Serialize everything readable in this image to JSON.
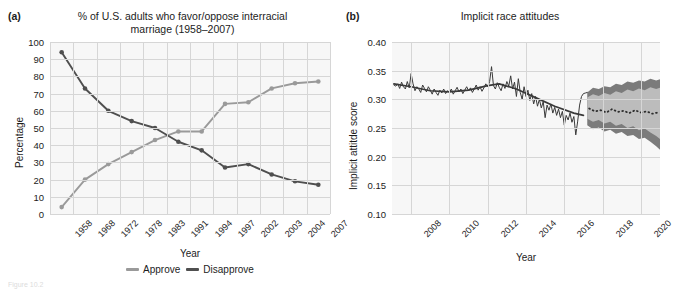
{
  "figure": {
    "background": "#ffffff",
    "caption_fragment": "Figure 10.2"
  },
  "panel_a": {
    "letter": "(a)",
    "title": "% of U.S. adults who favor/oppose interracial\nmarriage (1958–2007)",
    "title_line1": "% of U.S. adults who favor/oppose interracial",
    "title_line2": "marriage (1958–2007)",
    "xlabel": "Year",
    "ylabel": "Percentage",
    "legend": [
      {
        "label": "Approve",
        "color": "#9a9a9a"
      },
      {
        "label": "Disapprove",
        "color": "#4f4f4f"
      }
    ]
  },
  "panel_b": {
    "letter": "(b)",
    "title": "Implicit race attitudes",
    "xlabel": "Year",
    "ylabel": "Implicit attitde score"
  },
  "chart_data": [
    {
      "type": "line",
      "panel": "a",
      "title": "% of U.S. adults who favor/oppose interracial marriage (1958–2007)",
      "xlabel": "Year",
      "ylabel": "Percentage",
      "ylim": [
        0,
        100
      ],
      "yticks": [
        0,
        10,
        20,
        30,
        40,
        50,
        60,
        70,
        80,
        90,
        100
      ],
      "categories": [
        "1958",
        "1968",
        "1972",
        "1978",
        "1983",
        "1991",
        "1994",
        "1997",
        "2002",
        "2003",
        "2004",
        "2007"
      ],
      "grid": true,
      "legend_position": "bottom",
      "markers": true,
      "series": [
        {
          "name": "Approve",
          "color": "#9a9a9a",
          "values": [
            4,
            20,
            29,
            36,
            43,
            48,
            48,
            64,
            65,
            73,
            76,
            77
          ]
        },
        {
          "name": "Disapprove",
          "color": "#4f4f4f",
          "values": [
            94,
            73,
            60,
            54,
            50,
            42,
            37,
            27,
            29,
            23,
            19,
            17
          ]
        }
      ]
    },
    {
      "type": "line",
      "panel": "b",
      "title": "Implicit race attitudes",
      "xlabel": "Year",
      "ylabel": "Implicit attitde score",
      "ylim": [
        0.1,
        0.4
      ],
      "yticks": [
        0.1,
        0.15,
        0.2,
        0.25,
        0.3,
        0.35,
        0.4
      ],
      "xlim": [
        2007.0,
        2021.0
      ],
      "xticks": [
        2008,
        2010,
        2012,
        2014,
        2016,
        2018,
        2020
      ],
      "grid": true,
      "legend_position": "none",
      "forecast_start": 2017.2,
      "series": [
        {
          "name": "Observed",
          "color": "#3a3a3a",
          "style": "noisy-line",
          "x": [
            2007.1,
            2007.2,
            2007.3,
            2007.4,
            2007.5,
            2007.6,
            2007.7,
            2007.8,
            2007.9,
            2008.0,
            2008.1,
            2008.2,
            2008.3,
            2008.4,
            2008.5,
            2008.6,
            2008.7,
            2008.8,
            2008.9,
            2009.0,
            2009.1,
            2009.2,
            2009.3,
            2009.4,
            2009.5,
            2009.6,
            2009.7,
            2009.8,
            2009.9,
            2010.0,
            2010.1,
            2010.2,
            2010.3,
            2010.4,
            2010.5,
            2010.6,
            2010.7,
            2010.8,
            2010.9,
            2011.0,
            2011.1,
            2011.2,
            2011.3,
            2011.4,
            2011.5,
            2011.6,
            2011.7,
            2011.8,
            2011.9,
            2012.0,
            2012.1,
            2012.2,
            2012.3,
            2012.4,
            2012.5,
            2012.6,
            2012.7,
            2012.8,
            2012.9,
            2013.0,
            2013.1,
            2013.2,
            2013.3,
            2013.4,
            2013.5,
            2013.6,
            2013.7,
            2013.8,
            2013.9,
            2014.0,
            2014.1,
            2014.2,
            2014.3,
            2014.4,
            2014.5,
            2014.6,
            2014.7,
            2014.8,
            2014.9,
            2015.0,
            2015.1,
            2015.2,
            2015.3,
            2015.4,
            2015.5,
            2015.6,
            2015.7,
            2015.8,
            2015.9,
            2016.0,
            2016.1,
            2016.2,
            2016.3,
            2016.4,
            2016.5,
            2016.6,
            2016.7,
            2016.8,
            2016.9,
            2017.0,
            2017.1,
            2017.2
          ],
          "y": [
            0.325,
            0.323,
            0.327,
            0.319,
            0.33,
            0.322,
            0.318,
            0.331,
            0.32,
            0.345,
            0.327,
            0.315,
            0.322,
            0.318,
            0.312,
            0.325,
            0.319,
            0.313,
            0.322,
            0.316,
            0.309,
            0.318,
            0.312,
            0.307,
            0.316,
            0.311,
            0.318,
            0.31,
            0.315,
            0.312,
            0.318,
            0.309,
            0.315,
            0.321,
            0.313,
            0.318,
            0.31,
            0.316,
            0.322,
            0.315,
            0.32,
            0.312,
            0.318,
            0.325,
            0.316,
            0.322,
            0.314,
            0.32,
            0.327,
            0.322,
            0.331,
            0.357,
            0.324,
            0.318,
            0.329,
            0.321,
            0.315,
            0.327,
            0.319,
            0.331,
            0.323,
            0.341,
            0.318,
            0.33,
            0.305,
            0.336,
            0.312,
            0.3,
            0.322,
            0.305,
            0.316,
            0.298,
            0.31,
            0.292,
            0.305,
            0.288,
            0.3,
            0.285,
            0.296,
            0.268,
            0.29,
            0.281,
            0.292,
            0.276,
            0.286,
            0.272,
            0.283,
            0.268,
            0.279,
            0.255,
            0.272,
            0.264,
            0.276,
            0.26,
            0.27,
            0.238,
            0.262,
            0.29,
            0.305,
            0.31,
            0.311,
            0.312
          ]
        },
        {
          "name": "Trend",
          "color": "#3a3a3a",
          "style": "smooth-line",
          "x": [
            2007.1,
            2008.0,
            2009.0,
            2010.0,
            2011.0,
            2012.0,
            2012.6,
            2013.5,
            2014.5,
            2015.5,
            2016.5,
            2017.0
          ],
          "y": [
            0.327,
            0.322,
            0.315,
            0.313,
            0.316,
            0.324,
            0.327,
            0.318,
            0.303,
            0.288,
            0.276,
            0.272
          ]
        },
        {
          "name": "Forecast median",
          "color": "#2e2e2e",
          "style": "dotted",
          "x": [
            2017.3,
            2017.6,
            2017.9,
            2018.2,
            2018.5,
            2018.8,
            2019.1,
            2019.4,
            2019.7,
            2020.0,
            2020.3,
            2020.6,
            2020.9
          ],
          "y": [
            0.284,
            0.279,
            0.281,
            0.277,
            0.283,
            0.278,
            0.28,
            0.276,
            0.281,
            0.277,
            0.279,
            0.275,
            0.277
          ]
        }
      ],
      "bands": [
        {
          "name": "Outer interval",
          "color": "#7b7b7b",
          "x": [
            2017.2,
            2017.5,
            2017.8,
            2018.1,
            2018.4,
            2018.7,
            2019.0,
            2019.3,
            2019.6,
            2019.9,
            2020.2,
            2020.5,
            2020.8,
            2021.0
          ],
          "upper": [
            0.312,
            0.32,
            0.318,
            0.323,
            0.321,
            0.327,
            0.325,
            0.331,
            0.329,
            0.333,
            0.331,
            0.336,
            0.333,
            0.335
          ],
          "lower": [
            0.255,
            0.248,
            0.251,
            0.244,
            0.247,
            0.24,
            0.243,
            0.236,
            0.238,
            0.231,
            0.233,
            0.226,
            0.218,
            0.212
          ]
        },
        {
          "name": "Inner interval",
          "color": "#bcbcbc",
          "x": [
            2017.2,
            2017.5,
            2017.8,
            2018.1,
            2018.4,
            2018.7,
            2019.0,
            2019.3,
            2019.6,
            2019.9,
            2020.2,
            2020.5,
            2020.8,
            2021.0
          ],
          "upper": [
            0.303,
            0.309,
            0.306,
            0.311,
            0.308,
            0.314,
            0.311,
            0.317,
            0.314,
            0.319,
            0.316,
            0.321,
            0.318,
            0.32
          ],
          "lower": [
            0.266,
            0.261,
            0.264,
            0.258,
            0.261,
            0.254,
            0.257,
            0.25,
            0.253,
            0.246,
            0.249,
            0.242,
            0.236,
            0.231
          ]
        }
      ]
    }
  ]
}
